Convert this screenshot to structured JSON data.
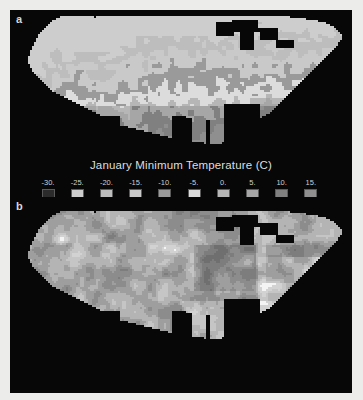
{
  "figure": {
    "background_color": "#ececeb",
    "panel_color": "#070707",
    "text_color": "#dedede"
  },
  "panels": [
    {
      "id": "a",
      "panel_label": "a",
      "legend_title": "January Minimum Temperature (C)"
    },
    {
      "id": "b",
      "panel_label": "b",
      "legend_title": "Percent Sand Content 0 - 50 cm Mode 1"
    }
  ],
  "legend_a": {
    "title": "January Minimum Temperature (C)",
    "labels": [
      "-30.",
      "-25.",
      "-20.",
      "-15.",
      "-10.",
      "-5.",
      "0.",
      "5.",
      "10.",
      "15."
    ],
    "colors": [
      "#2b2b2b",
      "#cdcdcd",
      "#bdbdbd",
      "#c9c9c9",
      "#9a9a9a",
      "#dcdcdc",
      "#b6b6b6",
      "#a6a6a6",
      "#808080",
      "#8f8f8f"
    ]
  },
  "legend_b": {
    "title": "Percent Sand Content 0 - 50 cm Mode 1",
    "labels": [
      "0.",
      "10.",
      "20.",
      "30.",
      "40.",
      "50.",
      "60.",
      "70.",
      "80.",
      "90."
    ],
    "colors": [
      "#f4f4f4",
      "#d2d2d2",
      "#c5c5c5",
      "#b4b4b4",
      "#9e9e9e",
      "#8c8c8c",
      "#7d7d7d",
      "#6f6f6f",
      "#646464",
      "#565656"
    ]
  },
  "chart_data": {
    "type": "heatmap",
    "n_maps": 2,
    "maps": [
      {
        "panel": "a",
        "title": "January Minimum Temperature (C)",
        "variable": "January minimum temperature",
        "units": "degrees Celsius",
        "region": "Conterminous United States",
        "class_breaks": [
          -30,
          -25,
          -20,
          -15,
          -10,
          -5,
          0,
          5,
          10,
          15
        ],
        "class_labels": [
          "-30.",
          "-25.",
          "-20.",
          "-15.",
          "-10.",
          "-5.",
          "0.",
          "5.",
          "10.",
          "15."
        ],
        "class_colors": [
          "#2b2b2b",
          "#cdcdcd",
          "#bdbdbd",
          "#c9c9c9",
          "#9a9a9a",
          "#dcdcdc",
          "#b6b6b6",
          "#a6a6a6",
          "#808080",
          "#8f8f8f"
        ],
        "colormap": "grayscale-discrete-10",
        "legend_position": "below",
        "spatial_pattern": "Latitudinal banding; coldest classes (-30 to -20 C) across the northern Great Plains and upper Midwest, warm classes (5 to 15 C) along the Gulf Coast, Florida and southern Pacific coast; mountainous West shows fine-grained mosaic."
      },
      {
        "panel": "b",
        "title": "Percent Sand Content 0 - 50 cm Mode 1",
        "variable": "Percent sand content, 0-50 cm depth, Mode 1",
        "units": "percent",
        "region": "Conterminous United States",
        "class_breaks": [
          0,
          10,
          20,
          30,
          40,
          50,
          60,
          70,
          80,
          90
        ],
        "class_labels": [
          "0.",
          "10.",
          "20.",
          "30.",
          "40.",
          "50.",
          "60.",
          "70.",
          "80.",
          "90."
        ],
        "class_colors": [
          "#f4f4f4",
          "#d2d2d2",
          "#c5c5c5",
          "#b4b4b4",
          "#9e9e9e",
          "#8c8c8c",
          "#7d7d7d",
          "#6f6f6f",
          "#646464",
          "#565656"
        ],
        "colormap": "grayscale-discrete-10-inverted",
        "legend_position": "below",
        "spatial_pattern": "High sand (bright, 0-20 class tones) in the Nebraska Sand Hills, parts of the Great Basin and Atlantic Coastal Plain; lower values (darker) through the Corn Belt, Mississippi Valley and Appalachians."
      }
    ]
  }
}
